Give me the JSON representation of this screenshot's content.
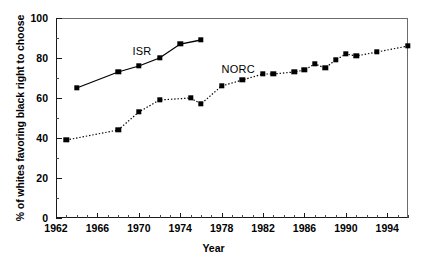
{
  "chart_data": {
    "type": "line",
    "title": "",
    "xlabel": "Year",
    "ylabel": "% of whites favoring black right to choose",
    "xlim": [
      1962,
      1996
    ],
    "ylim": [
      0,
      100
    ],
    "xticks": [
      1962,
      1966,
      1970,
      1974,
      1978,
      1982,
      1986,
      1990,
      1994
    ],
    "xtick_labels": [
      "1962",
      "1966",
      "1970",
      "1974",
      "1978",
      "1982",
      "1986",
      "1990",
      "1994"
    ],
    "x_minor_tick_interval": 1,
    "yticks": [
      0,
      20,
      40,
      60,
      80,
      100
    ],
    "ytick_labels": [
      "0",
      "20",
      "40",
      "60",
      "80",
      "100"
    ],
    "y_minor_tick_interval": 10,
    "grid": false,
    "legend_position": "inline-annotations",
    "series": [
      {
        "name": "ISR",
        "label": "ISR",
        "line_style": "solid",
        "marker": "square",
        "color": "#000000",
        "label_x": 1970.3,
        "label_y": 83.5,
        "points": [
          {
            "x": 1964,
            "y": 65
          },
          {
            "x": 1968,
            "y": 73
          },
          {
            "x": 1970,
            "y": 76
          },
          {
            "x": 1972,
            "y": 80
          },
          {
            "x": 1974,
            "y": 87
          },
          {
            "x": 1976,
            "y": 89
          }
        ]
      },
      {
        "name": "NORC",
        "label": "NORC",
        "line_style": "dotted",
        "marker": "square",
        "color": "#000000",
        "label_x": 1979.6,
        "label_y": 74.5,
        "points": [
          {
            "x": 1963,
            "y": 39
          },
          {
            "x": 1968,
            "y": 44
          },
          {
            "x": 1970,
            "y": 53
          },
          {
            "x": 1972,
            "y": 59
          },
          {
            "x": 1975,
            "y": 60
          },
          {
            "x": 1976,
            "y": 57
          },
          {
            "x": 1978,
            "y": 66
          },
          {
            "x": 1980,
            "y": 69
          },
          {
            "x": 1982,
            "y": 72
          },
          {
            "x": 1983,
            "y": 72
          },
          {
            "x": 1985,
            "y": 73
          },
          {
            "x": 1986,
            "y": 74
          },
          {
            "x": 1987,
            "y": 77
          },
          {
            "x": 1988,
            "y": 75
          },
          {
            "x": 1989,
            "y": 79
          },
          {
            "x": 1990,
            "y": 82
          },
          {
            "x": 1991,
            "y": 81
          },
          {
            "x": 1993,
            "y": 83
          },
          {
            "x": 1996,
            "y": 86
          }
        ]
      }
    ]
  }
}
